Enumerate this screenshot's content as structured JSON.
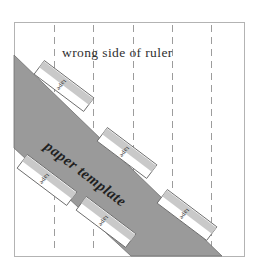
{
  "figure": {
    "title_label": "wrong side of ruler",
    "band_label": "paper template",
    "tape_label": "tape",
    "colors": {
      "band_fill": "#9a9a9a",
      "band_stroke": "#6f6f6f",
      "frame_stroke": "#b3b3b3",
      "dashed_stroke": "#9c9c9c",
      "tape_fill": "#ffffff",
      "tape_stroke": "#6b6b6b",
      "tape_inner_fill": "#c9c9c9",
      "text": "#2f2f2f",
      "background": "#ffffff"
    },
    "frame": {
      "left": 14,
      "top": 22,
      "right": 244,
      "bottom": 256
    },
    "dashed_lines_x": [
      54,
      93,
      133,
      172,
      211
    ],
    "band": {
      "top_edge": {
        "x1": 14,
        "y1": 55,
        "x2": 222,
        "y2": 256
      },
      "bottom_edge": {
        "x1": 14,
        "y1": 148,
        "x2": 131,
        "y2": 256
      },
      "angle_deg": 37
    },
    "tapes": [
      {
        "id": "tape-upper-left",
        "x": 64,
        "y": 86,
        "rotation": 37,
        "length": 62,
        "width": 17
      },
      {
        "id": "tape-middle",
        "x": 127,
        "y": 153,
        "rotation": 37,
        "length": 62,
        "width": 17
      },
      {
        "id": "tape-left-lower",
        "x": 47,
        "y": 180,
        "rotation": 37,
        "length": 62,
        "width": 17
      },
      {
        "id": "tape-bottom",
        "x": 106,
        "y": 222,
        "rotation": 37,
        "length": 62,
        "width": 17
      },
      {
        "id": "tape-right-lower",
        "x": 187,
        "y": 215,
        "rotation": 37,
        "length": 62,
        "width": 17
      }
    ]
  }
}
